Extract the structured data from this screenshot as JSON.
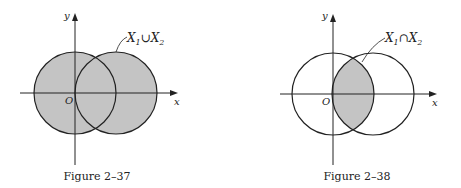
{
  "figures": [
    {
      "caption": "Figure 2–37",
      "label_main": "X",
      "label_sub1": "1",
      "op": "∪",
      "label_sub2": "2",
      "axis_x": "x",
      "axis_y": "y",
      "origin": "O",
      "shading": "union"
    },
    {
      "caption": "Figure 2–38",
      "label_main": "X",
      "label_sub1": "1",
      "op": "∩",
      "label_sub2": "2",
      "axis_x": "x",
      "axis_y": "y",
      "origin": "O",
      "shading": "intersection"
    }
  ],
  "colors": {
    "shade": "#c4c4c4",
    "stroke": "#222222"
  }
}
